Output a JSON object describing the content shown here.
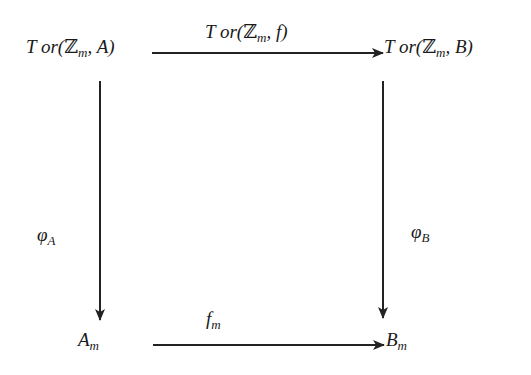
{
  "diagram": {
    "type": "commutative-square",
    "nodes": {
      "top_left": {
        "tor": "T or(",
        "z": "ℤ",
        "sub": "m",
        "rest": ", A)"
      },
      "top_right": {
        "tor": "T or(",
        "z": "ℤ",
        "sub": "m",
        "rest": ", B)"
      },
      "bottom_left": {
        "main": "A",
        "sub": "m"
      },
      "bottom_right": {
        "main": "B",
        "sub": "m"
      }
    },
    "arrows": {
      "top": {
        "tor": "T or(",
        "z": "ℤ",
        "sub": "m",
        "rest": ", f)"
      },
      "left": {
        "main": "φ",
        "sub": "A"
      },
      "right": {
        "main": "φ",
        "sub": "B"
      },
      "bottom": {
        "main": "f",
        "sub": "m"
      }
    },
    "colors": {
      "stroke": "#222222",
      "background": "#ffffff"
    }
  }
}
